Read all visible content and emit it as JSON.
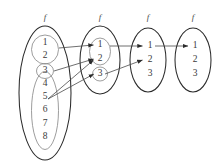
{
  "figure": {
    "type": "commutative-mapping-diagram",
    "background_color": "#ffffff",
    "outline_color": "#2b2b2b",
    "subset_outline_color": "#8b8b8b",
    "text_color": "#3a3a3a",
    "arrow_color": "#4a4a4a"
  },
  "map_labels": [
    {
      "id": "f1",
      "text": "f"
    },
    {
      "id": "f2",
      "text": "f"
    },
    {
      "id": "f3",
      "text": "f"
    },
    {
      "id": "f4",
      "text": "f"
    }
  ],
  "sets": [
    {
      "id": "set-1",
      "index": 1,
      "label": "f",
      "elements": [
        "1",
        "2",
        "3",
        "4",
        "5",
        "6",
        "7",
        "8"
      ],
      "subsets": [
        {
          "id": "subset-1a",
          "elements": [
            "1",
            "2"
          ]
        },
        {
          "id": "subset-1b",
          "elements": [
            "3"
          ]
        },
        {
          "id": "subset-1c",
          "elements": [
            "4",
            "5",
            "6",
            "7",
            "8"
          ]
        }
      ]
    },
    {
      "id": "set-2",
      "index": 2,
      "label": "f",
      "elements": [
        "1",
        "2",
        "3"
      ],
      "subsets": [
        {
          "id": "subset-2a",
          "elements": [
            "1",
            "2"
          ]
        },
        {
          "id": "subset-2b",
          "elements": [
            "3"
          ]
        }
      ]
    },
    {
      "id": "set-3",
      "index": 3,
      "label": "f",
      "elements": [
        "1",
        "2",
        "3"
      ],
      "subsets": []
    },
    {
      "id": "set-4",
      "index": 4,
      "label": "f",
      "elements": [
        "1",
        "2",
        "3"
      ],
      "subsets": []
    }
  ],
  "arrows": [
    {
      "id": "arrow-1",
      "from_set": 1,
      "from_element": "1",
      "to_set": 2,
      "to_element": "1"
    },
    {
      "id": "arrow-2",
      "from_set": 1,
      "from_element": "3",
      "to_set": 2,
      "to_element": "2"
    },
    {
      "id": "arrow-3",
      "from_set": 1,
      "from_element": "5",
      "to_set": 2,
      "to_element": "2"
    },
    {
      "id": "arrow-4",
      "from_set": 1,
      "from_element": "5",
      "to_set": 2,
      "to_element": "3"
    },
    {
      "id": "arrow-5",
      "from_set": 2,
      "from_element": "1",
      "to_set": 3,
      "to_element": "1"
    },
    {
      "id": "arrow-6",
      "from_set": 2,
      "from_element": "3",
      "to_set": 3,
      "to_element": "2"
    },
    {
      "id": "arrow-7",
      "from_set": 3,
      "from_element": "1",
      "to_set": 4,
      "to_element": "1"
    }
  ],
  "element_positions": {
    "set1": [
      {
        "value": "1",
        "x": 45,
        "y": 43
      },
      {
        "value": "2",
        "x": 45,
        "y": 56
      },
      {
        "value": "3",
        "x": 45,
        "y": 71
      },
      {
        "value": "4",
        "x": 45,
        "y": 84
      },
      {
        "value": "5",
        "x": 45,
        "y": 97
      },
      {
        "value": "6",
        "x": 45,
        "y": 110
      },
      {
        "value": "7",
        "x": 45,
        "y": 124
      },
      {
        "value": "8",
        "x": 45,
        "y": 137
      }
    ],
    "set2": [
      {
        "value": "1",
        "x": 100,
        "y": 45
      },
      {
        "value": "2",
        "x": 100,
        "y": 59
      },
      {
        "value": "3",
        "x": 100,
        "y": 74
      }
    ],
    "set3": [
      {
        "value": "1",
        "x": 148,
        "y": 46
      },
      {
        "value": "2",
        "x": 148,
        "y": 60
      },
      {
        "value": "3",
        "x": 148,
        "y": 74
      }
    ],
    "set4": [
      {
        "value": "1",
        "x": 194,
        "y": 46
      },
      {
        "value": "2",
        "x": 194,
        "y": 60
      },
      {
        "value": "3",
        "x": 194,
        "y": 74
      }
    ]
  }
}
